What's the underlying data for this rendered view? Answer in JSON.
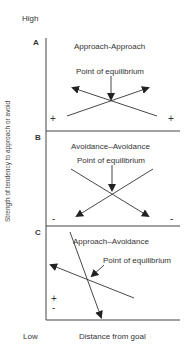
{
  "axis": {
    "high_label": "High",
    "low_label": "Low",
    "x_label": "Distance from goal",
    "y_label": "Strength of tendency to approach or avoid"
  },
  "panels": [
    {
      "letter": "A",
      "title": "Approach-Approach",
      "equilibrium_label": "Point of equilibrium",
      "signs": [
        "+",
        "+"
      ]
    },
    {
      "letter": "B",
      "title": "Avoidance–Avoidance",
      "equilibrium_label": "Point of equilibrium",
      "signs": [
        "-",
        "-"
      ]
    },
    {
      "letter": "C",
      "title": "Approach–Avoidance",
      "equilibrium_label": "Point of equilibrium",
      "signs": [
        "+",
        "-"
      ]
    }
  ]
}
